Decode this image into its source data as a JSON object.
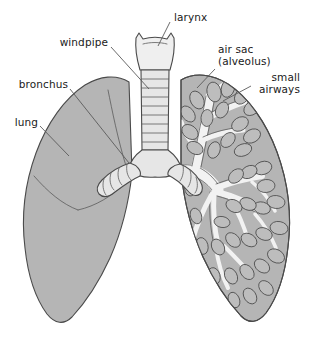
{
  "diagram": {
    "background_color": "#ffffff",
    "labels": {
      "larynx": "larynx",
      "windpipe": "windpipe",
      "bronchus": "bronchus",
      "lung": "lung",
      "air_sac_line1": "air sac",
      "air_sac_line2": "(alveolus)",
      "small_airways_line1": "small",
      "small_airways_line2": "airways"
    },
    "colors": {
      "lung_fill": "#b5b5b5",
      "lung_fill_light": "#c4c4c4",
      "airway_fill": "#efefef",
      "airway_fill_shadow": "#d6d6d6",
      "outline": "#4a4a4a",
      "leader": "#5a5a5a",
      "text": "#1a1a1a",
      "alveolus_fill": "#bdbdbd",
      "tree_fill": "#f4f4f4"
    },
    "parts": [
      "larynx",
      "trachea",
      "left-main-bronchus",
      "right-main-bronchus",
      "left-lung",
      "right-lung",
      "bronchial-tree",
      "alveoli-clusters"
    ]
  }
}
